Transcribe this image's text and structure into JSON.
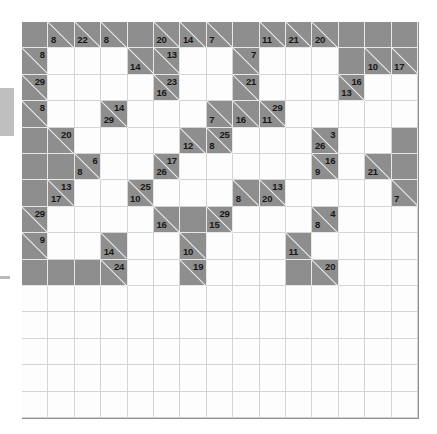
{
  "puzzle": {
    "name": "Kakuro Puzzle Grid",
    "type": "kakuro",
    "rows": 15,
    "cols": 15,
    "cell_size_px": 26.4,
    "colors": {
      "block": "#8e8e8e",
      "white": "#fdfdfd",
      "grid_line": "#d5d5d5",
      "block_line": "#e8e8e8",
      "clue_text": "#171717"
    },
    "legend": {
      "across_clue_position": "upper-right of block cell",
      "down_clue_position": "lower-left of block cell"
    },
    "cells": [
      [
        {
          "t": "block"
        },
        {
          "t": "clue",
          "down": "8"
        },
        {
          "t": "clue",
          "down": "22"
        },
        {
          "t": "clue",
          "down": "8"
        },
        {
          "t": "block"
        },
        {
          "t": "clue",
          "down": "20"
        },
        {
          "t": "clue",
          "down": "14"
        },
        {
          "t": "clue",
          "down": "7"
        },
        {
          "t": "block"
        },
        {
          "t": "clue",
          "down": "11"
        },
        {
          "t": "clue",
          "down": "21"
        },
        {
          "t": "clue",
          "down": "20"
        },
        {
          "t": "block"
        },
        {
          "t": "block"
        },
        {
          "t": "block"
        }
      ],
      [
        {
          "t": "clue",
          "across": "8"
        },
        {
          "t": "white"
        },
        {
          "t": "white"
        },
        {
          "t": "white"
        },
        {
          "t": "clue",
          "down": "14"
        },
        {
          "t": "clue",
          "across": "13"
        },
        {
          "t": "white"
        },
        {
          "t": "white"
        },
        {
          "t": "clue",
          "across": "7"
        },
        {
          "t": "white"
        },
        {
          "t": "white"
        },
        {
          "t": "white"
        },
        {
          "t": "block"
        },
        {
          "t": "clue",
          "down": "10"
        },
        {
          "t": "clue",
          "down": "17"
        }
      ],
      [
        {
          "t": "clue",
          "across": "29"
        },
        {
          "t": "white"
        },
        {
          "t": "white"
        },
        {
          "t": "white"
        },
        {
          "t": "white"
        },
        {
          "t": "clue",
          "across": "23",
          "down": "16"
        },
        {
          "t": "white"
        },
        {
          "t": "white"
        },
        {
          "t": "clue",
          "across": "21"
        },
        {
          "t": "white"
        },
        {
          "t": "white"
        },
        {
          "t": "white"
        },
        {
          "t": "clue",
          "across": "16",
          "down": "13"
        },
        {
          "t": "white"
        },
        {
          "t": "white"
        }
      ],
      [
        {
          "t": "clue",
          "across": "8"
        },
        {
          "t": "white"
        },
        {
          "t": "white"
        },
        {
          "t": "clue",
          "across": "14",
          "down": "29"
        },
        {
          "t": "white"
        },
        {
          "t": "white"
        },
        {
          "t": "white"
        },
        {
          "t": "clue",
          "down": "7"
        },
        {
          "t": "clue",
          "down": "16"
        },
        {
          "t": "clue",
          "across": "29",
          "down": "11"
        },
        {
          "t": "white"
        },
        {
          "t": "white"
        },
        {
          "t": "white"
        },
        {
          "t": "white"
        },
        {
          "t": "white"
        }
      ],
      [
        {
          "t": "block"
        },
        {
          "t": "clue",
          "across": "20"
        },
        {
          "t": "white"
        },
        {
          "t": "white"
        },
        {
          "t": "white"
        },
        {
          "t": "white"
        },
        {
          "t": "clue",
          "down": "12"
        },
        {
          "t": "clue",
          "across": "25",
          "down": "8"
        },
        {
          "t": "white"
        },
        {
          "t": "white"
        },
        {
          "t": "white"
        },
        {
          "t": "clue",
          "across": "3",
          "down": "26"
        },
        {
          "t": "white"
        },
        {
          "t": "white"
        },
        {
          "t": "block"
        }
      ],
      [
        {
          "t": "block"
        },
        {
          "t": "block"
        },
        {
          "t": "clue",
          "across": "6",
          "down": "8"
        },
        {
          "t": "white"
        },
        {
          "t": "white"
        },
        {
          "t": "clue",
          "across": "17",
          "down": "26"
        },
        {
          "t": "white"
        },
        {
          "t": "white"
        },
        {
          "t": "white"
        },
        {
          "t": "white"
        },
        {
          "t": "white"
        },
        {
          "t": "clue",
          "across": "16",
          "down": "9"
        },
        {
          "t": "white"
        },
        {
          "t": "clue",
          "down": "21"
        },
        {
          "t": "block"
        }
      ],
      [
        {
          "t": "block"
        },
        {
          "t": "clue",
          "across": "13",
          "down": "17"
        },
        {
          "t": "white"
        },
        {
          "t": "white"
        },
        {
          "t": "clue",
          "across": "25",
          "down": "10"
        },
        {
          "t": "white"
        },
        {
          "t": "white"
        },
        {
          "t": "white"
        },
        {
          "t": "clue",
          "down": "8"
        },
        {
          "t": "clue",
          "across": "13",
          "down": "20"
        },
        {
          "t": "white"
        },
        {
          "t": "white"
        },
        {
          "t": "white"
        },
        {
          "t": "white"
        },
        {
          "t": "clue",
          "down": "7"
        }
      ],
      [
        {
          "t": "clue",
          "across": "29"
        },
        {
          "t": "white"
        },
        {
          "t": "white"
        },
        {
          "t": "white"
        },
        {
          "t": "white"
        },
        {
          "t": "clue",
          "down": "16"
        },
        {
          "t": "block"
        },
        {
          "t": "clue",
          "across": "29",
          "down": "15"
        },
        {
          "t": "white"
        },
        {
          "t": "white"
        },
        {
          "t": "white"
        },
        {
          "t": "clue",
          "across": "4",
          "down": "8"
        },
        {
          "t": "white"
        },
        {
          "t": "white"
        },
        {
          "t": "white"
        }
      ],
      [
        {
          "t": "clue",
          "across": "9"
        },
        {
          "t": "white"
        },
        {
          "t": "white"
        },
        {
          "t": "clue",
          "down": "14"
        },
        {
          "t": "white"
        },
        {
          "t": "white"
        },
        {
          "t": "clue",
          "down": "10"
        },
        {
          "t": "white"
        },
        {
          "t": "white"
        },
        {
          "t": "white"
        },
        {
          "t": "clue",
          "down": "11"
        },
        {
          "t": "white"
        },
        {
          "t": "white"
        },
        {
          "t": "white"
        },
        {
          "t": "white"
        }
      ],
      [
        {
          "t": "block"
        },
        {
          "t": "block"
        },
        {
          "t": "block"
        },
        {
          "t": "clue",
          "across": "24"
        },
        {
          "t": "white"
        },
        {
          "t": "white"
        },
        {
          "t": "clue",
          "across": "19"
        },
        {
          "t": "white"
        },
        {
          "t": "white"
        },
        {
          "t": "white"
        },
        {
          "t": "block"
        },
        {
          "t": "clue",
          "across": "20"
        },
        {
          "t": "white"
        },
        {
          "t": "white"
        },
        {
          "t": "white"
        }
      ],
      [
        {
          "t": "white"
        },
        {
          "t": "white"
        },
        {
          "t": "white"
        },
        {
          "t": "white"
        },
        {
          "t": "white"
        },
        {
          "t": "white"
        },
        {
          "t": "white"
        },
        {
          "t": "white"
        },
        {
          "t": "white"
        },
        {
          "t": "white"
        },
        {
          "t": "white"
        },
        {
          "t": "white"
        },
        {
          "t": "white"
        },
        {
          "t": "white"
        },
        {
          "t": "white"
        }
      ],
      [
        {
          "t": "white"
        },
        {
          "t": "white"
        },
        {
          "t": "white"
        },
        {
          "t": "white"
        },
        {
          "t": "white"
        },
        {
          "t": "white"
        },
        {
          "t": "white"
        },
        {
          "t": "white"
        },
        {
          "t": "white"
        },
        {
          "t": "white"
        },
        {
          "t": "white"
        },
        {
          "t": "white"
        },
        {
          "t": "white"
        },
        {
          "t": "white"
        },
        {
          "t": "white"
        }
      ],
      [
        {
          "t": "white"
        },
        {
          "t": "white"
        },
        {
          "t": "white"
        },
        {
          "t": "white"
        },
        {
          "t": "white"
        },
        {
          "t": "white"
        },
        {
          "t": "white"
        },
        {
          "t": "white"
        },
        {
          "t": "white"
        },
        {
          "t": "white"
        },
        {
          "t": "white"
        },
        {
          "t": "white"
        },
        {
          "t": "white"
        },
        {
          "t": "white"
        },
        {
          "t": "white"
        }
      ],
      [
        {
          "t": "white"
        },
        {
          "t": "white"
        },
        {
          "t": "white"
        },
        {
          "t": "white"
        },
        {
          "t": "white"
        },
        {
          "t": "white"
        },
        {
          "t": "white"
        },
        {
          "t": "white"
        },
        {
          "t": "white"
        },
        {
          "t": "white"
        },
        {
          "t": "white"
        },
        {
          "t": "white"
        },
        {
          "t": "white"
        },
        {
          "t": "white"
        },
        {
          "t": "white"
        }
      ],
      [
        {
          "t": "white"
        },
        {
          "t": "white"
        },
        {
          "t": "white"
        },
        {
          "t": "white"
        },
        {
          "t": "white"
        },
        {
          "t": "white"
        },
        {
          "t": "white"
        },
        {
          "t": "white"
        },
        {
          "t": "white"
        },
        {
          "t": "white"
        },
        {
          "t": "white"
        },
        {
          "t": "white"
        },
        {
          "t": "white"
        },
        {
          "t": "white"
        },
        {
          "t": "white"
        }
      ]
    ]
  }
}
